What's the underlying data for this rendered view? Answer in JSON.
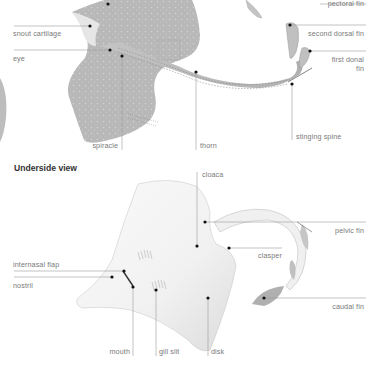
{
  "diagram": {
    "sections": [
      {
        "id": "top-view",
        "heading": "",
        "labels": {
          "pectoral_fin": "pectoral fin",
          "snout_cartilage": "snout cartilage",
          "second_dorsal_fin": "second dorsal fin",
          "eye": "eye",
          "first_dorsal_fin_line1": "first donal",
          "first_dorsal_fin_line2": "fin",
          "stinging_spine": "stinging spine",
          "spiracle": "spiracle",
          "thorn": "thorn"
        }
      },
      {
        "id": "underside-view",
        "heading": "Underside view",
        "labels": {
          "cloaca": "cloaca",
          "pelvic_fin": "pelvic fin",
          "clasper": "clasper",
          "internasal_flap": "internasal flap",
          "nostril": "nostril",
          "caudal_fin": "caudal fin",
          "mouth": "mouth",
          "gill_slit": "gill slit",
          "disk": "disk"
        }
      }
    ],
    "colors": {
      "leader_line": "#9a9a9a",
      "label_text": "#7a7a7a",
      "heading_text": "#333333",
      "top_body": "#b9b9b9",
      "under_body": "#f4f4f4",
      "dot": "#111111"
    }
  }
}
